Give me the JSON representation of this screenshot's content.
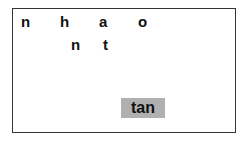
{
  "letters": [
    {
      "char": "n",
      "x": 21,
      "y": 14
    },
    {
      "char": "h",
      "x": 60,
      "y": 14
    },
    {
      "char": "a",
      "x": 99,
      "y": 14
    },
    {
      "char": "o",
      "x": 138,
      "y": 14
    },
    {
      "char": "n",
      "x": 71,
      "y": 37
    },
    {
      "char": "t",
      "x": 103,
      "y": 37
    }
  ],
  "button": {
    "label": "tan",
    "color": "#b0b0b0"
  }
}
